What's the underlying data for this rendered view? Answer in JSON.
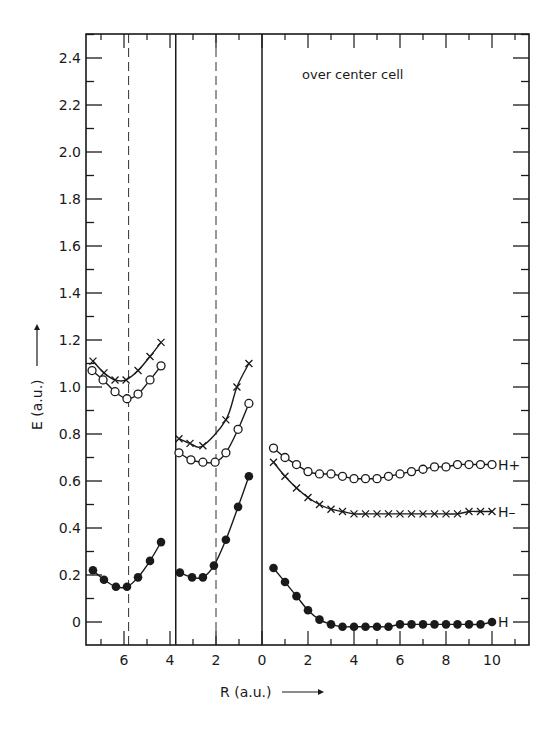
{
  "chart_data": {
    "type": "line",
    "title": "",
    "annotation": "over center cell",
    "xlabel": "R (a.u.)",
    "ylabel": "E (a.u.)",
    "ylim": [
      -0.1,
      2.5
    ],
    "yticks": [
      "0",
      "0.2",
      "0.4",
      "0.6",
      "0.8",
      "1.0",
      "1.2",
      "1.4",
      "1.6",
      "1.8",
      "2.0",
      "2.2",
      "2.4"
    ],
    "grid": false,
    "legend": "inline labels at right end of curves",
    "panels": [
      {
        "name": "left",
        "x_direction": "reversed",
        "xticks": [
          "6",
          "4"
        ],
        "dashed_line_R": 5.8,
        "boundary_R": 3.75,
        "series": [
          {
            "name": "H-",
            "marker": "x",
            "R": [
              7.35,
              6.87,
              6.39,
              5.91,
              5.39,
              4.87,
              4.39
            ],
            "E": [
              1.11,
              1.06,
              1.03,
              1.03,
              1.07,
              1.13,
              1.19
            ]
          },
          {
            "name": "H+",
            "marker": "open-circle",
            "R": [
              7.39,
              6.91,
              6.39,
              5.87,
              5.39,
              4.87,
              4.39
            ],
            "E": [
              1.07,
              1.03,
              0.98,
              0.95,
              0.97,
              1.03,
              1.09
            ]
          },
          {
            "name": "H",
            "marker": "filled-circle",
            "R": [
              7.35,
              6.87,
              6.35,
              5.87,
              5.39,
              4.87,
              4.39
            ],
            "E": [
              0.22,
              0.18,
              0.15,
              0.15,
              0.19,
              0.26,
              0.34
            ]
          }
        ]
      },
      {
        "name": "middle",
        "x_direction": "reversed",
        "xticks": [
          "2",
          "0"
        ],
        "dashed_line_R": 2.0,
        "series": [
          {
            "name": "H-",
            "marker": "x",
            "R": [
              3.61,
              3.13,
              2.57,
              1.57,
              1.09,
              0.57
            ],
            "E": [
              0.78,
              0.76,
              0.75,
              0.86,
              1.0,
              1.1
            ]
          },
          {
            "name": "H+",
            "marker": "open-circle",
            "R": [
              3.61,
              3.09,
              2.57,
              2.04,
              1.57,
              1.04,
              0.57
            ],
            "E": [
              0.72,
              0.69,
              0.68,
              0.68,
              0.72,
              0.82,
              0.93
            ]
          },
          {
            "name": "H",
            "marker": "filled-circle",
            "R": [
              3.57,
              3.04,
              2.57,
              2.09,
              1.57,
              1.04,
              0.57
            ],
            "E": [
              0.21,
              0.19,
              0.19,
              0.24,
              0.35,
              0.49,
              0.62
            ]
          }
        ]
      },
      {
        "name": "right",
        "x_direction": "normal",
        "xticks": [
          "2",
          "4",
          "6",
          "8",
          "10"
        ],
        "series": [
          {
            "name": "H+",
            "label": "H+",
            "marker": "open-circle",
            "R": [
              0.5,
              1.0,
              1.5,
              2.0,
              2.5,
              3.0,
              3.5,
              4.0,
              4.5,
              5.0,
              5.5,
              6.0,
              6.5,
              7.0,
              7.5,
              8.0,
              8.5,
              9.0,
              9.5,
              10.0
            ],
            "E": [
              0.74,
              0.7,
              0.67,
              0.64,
              0.63,
              0.63,
              0.62,
              0.61,
              0.61,
              0.61,
              0.62,
              0.63,
              0.64,
              0.65,
              0.66,
              0.66,
              0.67,
              0.67,
              0.67,
              0.67
            ]
          },
          {
            "name": "H-",
            "label": "H–",
            "marker": "x",
            "R": [
              0.5,
              1.0,
              1.5,
              2.0,
              2.5,
              3.0,
              3.5,
              4.0,
              4.5,
              5.0,
              5.5,
              6.0,
              6.5,
              7.0,
              7.5,
              8.0,
              8.5,
              9.0,
              9.5,
              10.0
            ],
            "E": [
              0.68,
              0.62,
              0.57,
              0.53,
              0.5,
              0.48,
              0.47,
              0.46,
              0.46,
              0.46,
              0.46,
              0.46,
              0.46,
              0.46,
              0.46,
              0.46,
              0.46,
              0.47,
              0.47,
              0.47
            ]
          },
          {
            "name": "H",
            "label": "H",
            "marker": "filled-circle",
            "R": [
              0.5,
              1.0,
              1.5,
              2.0,
              2.5,
              3.0,
              3.5,
              4.0,
              4.5,
              5.0,
              5.5,
              6.0,
              6.5,
              7.0,
              7.5,
              8.0,
              8.5,
              9.0,
              9.5,
              10.0
            ],
            "E": [
              0.23,
              0.17,
              0.11,
              0.05,
              0.01,
              -0.01,
              -0.02,
              -0.02,
              -0.02,
              -0.02,
              -0.02,
              -0.01,
              -0.01,
              -0.01,
              -0.01,
              -0.01,
              -0.01,
              -0.01,
              -0.01,
              0.0
            ]
          }
        ]
      }
    ]
  }
}
